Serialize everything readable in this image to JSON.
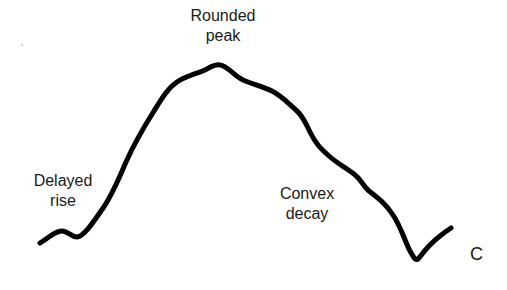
{
  "diagram": {
    "panel_label": "C",
    "annotations": {
      "peak": {
        "line1": "Rounded",
        "line2": "peak"
      },
      "rise": {
        "line1": "Delayed",
        "line2": "rise"
      },
      "decay": {
        "line1": "Convex",
        "line2": "decay"
      }
    },
    "curve": {
      "stroke_color": "#000000",
      "stroke_width": 5,
      "path": "M40,243 C48,238 54,232 61,231 C67,230 71,237 77,237 C84,236 92,224 101,211 C112,196 118,180 126,162 C134,144 142,130 154,111 C162,98 168,88 177,82 C186,76 196,74 205,70 C211,67 215,64 220,65 C228,66 234,76 243,80 C252,84 262,86 272,91 C282,96 289,104 296,110 C303,116 305,122 310,132 C316,144 320,148 329,156 C338,164 345,167 354,174 C362,180 361,184 369,191 C378,198 386,204 393,215 C401,227 404,239 410,251 C414,258 416,262 419,258 C425,250 432,242 440,236 C445,232 448,230 451,228"
    },
    "background_color": "#ffffff",
    "text_color": "#1a1a1a"
  }
}
